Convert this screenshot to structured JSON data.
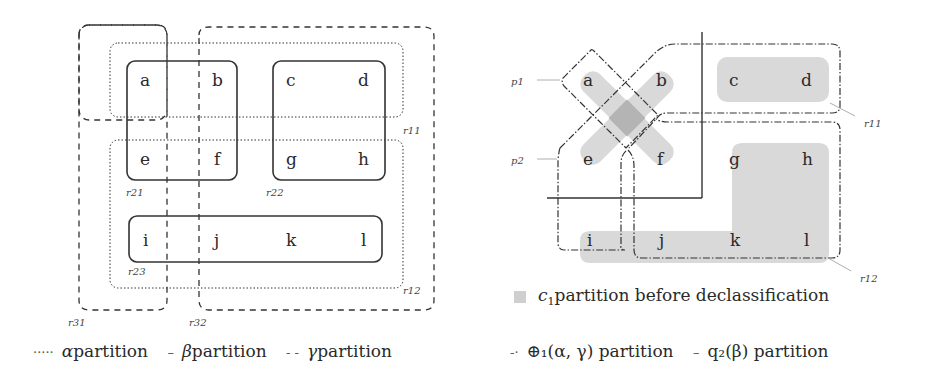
{
  "left_diagram": {
    "cells": [
      {
        "id": "a",
        "x": 145,
        "y": 86
      },
      {
        "id": "b",
        "x": 218,
        "y": 86
      },
      {
        "id": "c",
        "x": 291,
        "y": 86
      },
      {
        "id": "d",
        "x": 364,
        "y": 86
      },
      {
        "id": "e",
        "x": 145,
        "y": 165
      },
      {
        "id": "f",
        "x": 218,
        "y": 165
      },
      {
        "id": "g",
        "x": 291,
        "y": 165
      },
      {
        "id": "h",
        "x": 364,
        "y": 165
      },
      {
        "id": "i",
        "x": 145,
        "y": 249
      },
      {
        "id": "j",
        "x": 218,
        "y": 249
      },
      {
        "id": "k",
        "x": 291,
        "y": 249
      },
      {
        "id": "l",
        "x": 364,
        "y": 249
      }
    ],
    "region_labels": {
      "r11": "r11",
      "r12": "r12",
      "r21": "r21",
      "r22": "r22",
      "r23": "r23",
      "r31": "r31",
      "r32": "r32"
    },
    "legend": {
      "alpha_mark": "·····",
      "alpha_sym": "α",
      "alpha_text": " partition",
      "beta_mark": "–",
      "beta_sym": "β",
      "beta_text": " partition",
      "gamma_mark": "- -",
      "gamma_sym": "γ",
      "gamma_text": " partition"
    }
  },
  "right_diagram": {
    "cells": [
      "a",
      "b",
      "c",
      "d",
      "e",
      "f",
      "g",
      "h",
      "i",
      "j",
      "k",
      "l"
    ],
    "region_labels": {
      "p1": "p1",
      "p2": "p2",
      "r11": "r11",
      "r12": "r12"
    },
    "shade_legend": {
      "sym": "c",
      "sub": "1",
      "text": " partition before declassification"
    },
    "legend": {
      "oplus_mark": "-·",
      "oplus_text": "⊕₁(α, γ) partition",
      "q_mark": "–",
      "q_text": "q₂(β) partition"
    }
  },
  "colors": {
    "shade": "#d6d6d6",
    "shade_dark": "#aaaaaa",
    "line": "#333333"
  }
}
